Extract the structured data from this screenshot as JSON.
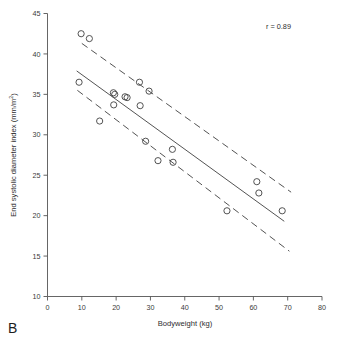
{
  "figure": {
    "panel_label": "B",
    "annotation": "r = 0.89"
  },
  "chart_data": {
    "type": "scatter",
    "title": "",
    "xlabel": "Bodyweight (kg)",
    "ylabel": "End systolic diameter index (mm/m²)",
    "ylabel_base": "End systolic diameter index (mm/m",
    "ylabel_sup": "2",
    "ylabel_tail": ")",
    "xlim": [
      0,
      80
    ],
    "ylim": [
      10,
      45
    ],
    "xticks": [
      0,
      10,
      20,
      30,
      40,
      50,
      60,
      70,
      80
    ],
    "yticks": [
      10,
      15,
      20,
      25,
      30,
      35,
      40,
      45
    ],
    "grid": false,
    "legend": null,
    "annotations": [
      {
        "text": "r = 0.89",
        "x": 66,
        "y": 43.6
      }
    ],
    "points": [
      {
        "x": 9.8,
        "y": 42.5
      },
      {
        "x": 12.2,
        "y": 41.9
      },
      {
        "x": 9.2,
        "y": 36.5
      },
      {
        "x": 15.2,
        "y": 31.7
      },
      {
        "x": 19.2,
        "y": 35.2
      },
      {
        "x": 19.6,
        "y": 35.0
      },
      {
        "x": 19.3,
        "y": 33.7
      },
      {
        "x": 22.6,
        "y": 34.7
      },
      {
        "x": 23.2,
        "y": 34.6
      },
      {
        "x": 26.8,
        "y": 36.5
      },
      {
        "x": 27.0,
        "y": 33.6
      },
      {
        "x": 28.6,
        "y": 29.2
      },
      {
        "x": 29.6,
        "y": 35.4
      },
      {
        "x": 32.2,
        "y": 26.8
      },
      {
        "x": 36.4,
        "y": 28.2
      },
      {
        "x": 36.6,
        "y": 26.6
      },
      {
        "x": 52.3,
        "y": 20.6
      },
      {
        "x": 61.0,
        "y": 24.2
      },
      {
        "x": 61.6,
        "y": 22.8
      },
      {
        "x": 68.4,
        "y": 20.6
      }
    ],
    "fit_line": {
      "name": "regression line",
      "style": "solid",
      "x_start": 8.5,
      "y_start": 37.9,
      "x_end": 69.0,
      "y_end": 19.3
    },
    "confidence_bands": [
      {
        "name": "upper confidence limit",
        "style": "dashed",
        "x_start": 10.0,
        "y_start": 41.3,
        "x_end": 71.0,
        "y_end": 22.9
      },
      {
        "name": "lower confidence limit",
        "style": "dashed",
        "x_start": 8.7,
        "y_start": 35.5,
        "x_end": 70.5,
        "y_end": 15.6
      }
    ]
  }
}
